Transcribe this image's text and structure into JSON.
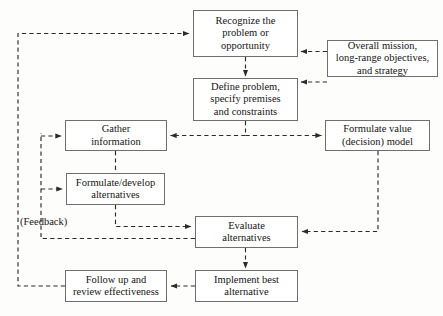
{
  "diagram": {
    "style": {
      "box_border_color": "#6f6f6f",
      "edge_color": "#2b2b2b",
      "text_color": "#141414",
      "background": "#fdfdfc",
      "edge_style": "dashed"
    },
    "nodes": [
      {
        "id": "recognize",
        "label": "Recognize the\nproblem or\nopportunity",
        "x": 193,
        "y": 10,
        "w": 105,
        "h": 47
      },
      {
        "id": "overall-mission",
        "label": "Overall mission,\nlong-range objectives,\nand strategy",
        "x": 327,
        "y": 40,
        "w": 111,
        "h": 37
      },
      {
        "id": "define-problem",
        "label": "Define problem,\nspecify premises\nand constraints",
        "x": 193,
        "y": 78,
        "w": 105,
        "h": 43
      },
      {
        "id": "gather-information",
        "label": "Gather\ninformation",
        "x": 65,
        "y": 120,
        "w": 102,
        "h": 31
      },
      {
        "id": "formulate-value-model",
        "label": "Formulate value\n(decision) model",
        "x": 325,
        "y": 120,
        "w": 105,
        "h": 31
      },
      {
        "id": "formulate-alternatives",
        "label": "Formulate/develop\nalternatives",
        "x": 66,
        "y": 173,
        "w": 99,
        "h": 32
      },
      {
        "id": "evaluate-alternatives",
        "label": "Evaluate\nalternatives",
        "x": 195,
        "y": 216,
        "w": 103,
        "h": 32
      },
      {
        "id": "follow-up",
        "label": "Follow up and\nreview effectiveness",
        "x": 65,
        "y": 270,
        "w": 102,
        "h": 32
      },
      {
        "id": "implement-best",
        "label": "Implement best\nalternative",
        "x": 195,
        "y": 270,
        "w": 103,
        "h": 32
      }
    ],
    "captions": [
      {
        "id": "feedback",
        "label": "(Feedback)",
        "x": 20,
        "y": 216
      }
    ],
    "edges": [
      {
        "id": "recognize-to-define",
        "from": "recognize",
        "to": "define-problem",
        "kind": "dashed-arrow"
      },
      {
        "id": "mission-to-recognize",
        "from": "overall-mission",
        "to": "recognize",
        "kind": "dashed-arrow"
      },
      {
        "id": "mission-to-define",
        "from": "overall-mission",
        "to": "define-problem",
        "kind": "dashed-arrow"
      },
      {
        "id": "define-to-gather",
        "from": "define-problem",
        "to": "gather-information",
        "kind": "dashed-arrow"
      },
      {
        "id": "define-to-value-model",
        "from": "define-problem",
        "to": "formulate-value-model",
        "kind": "dashed-arrow"
      },
      {
        "id": "gather-to-formulate-alternatives",
        "from": "gather-information",
        "to": "formulate-alternatives",
        "kind": "dashed-line"
      },
      {
        "id": "formulate-alternatives-to-evaluate",
        "from": "formulate-alternatives",
        "to": "evaluate-alternatives",
        "kind": "dashed-arrow"
      },
      {
        "id": "value-model-to-evaluate",
        "from": "formulate-value-model",
        "to": "evaluate-alternatives",
        "kind": "dashed-arrow"
      },
      {
        "id": "evaluate-feedback-to-gather",
        "from": "evaluate-alternatives",
        "to": "gather-information",
        "kind": "dashed-arrow"
      },
      {
        "id": "evaluate-feedback-to-formulate-alternatives",
        "from": "evaluate-alternatives",
        "to": "formulate-alternatives",
        "kind": "dashed-arrow"
      },
      {
        "id": "evaluate-to-implement",
        "from": "evaluate-alternatives",
        "to": "implement-best",
        "kind": "dashed-arrow"
      },
      {
        "id": "implement-to-follow-up",
        "from": "implement-best",
        "to": "follow-up",
        "kind": "dashed-arrow"
      },
      {
        "id": "follow-up-to-recognize",
        "from": "follow-up",
        "to": "recognize",
        "kind": "dashed-arrow"
      }
    ]
  }
}
